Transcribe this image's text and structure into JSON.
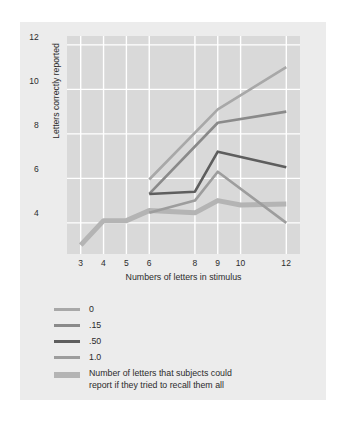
{
  "chart_data": {
    "type": "line",
    "title": "",
    "subtitle": "",
    "xlabel": "Numbers of letters in stimulus",
    "ylabel": "Letters correctly reported",
    "x": [
      3,
      4,
      5,
      6,
      8,
      9,
      10,
      12
    ],
    "xtick_labels": [
      "3",
      "4",
      "5",
      "6",
      "8",
      "9",
      "10",
      "12"
    ],
    "ytick_labels": [
      "4",
      "6",
      "8",
      "10",
      "12"
    ],
    "yticks": [
      4,
      6,
      8,
      10,
      12
    ],
    "xlim": [
      2.4,
      12.6
    ],
    "ylim": [
      2.6,
      12.4
    ],
    "grid": true,
    "grid_color": "#ffffff",
    "plot_background": "#d9d9d9",
    "figure_background": "#ececec",
    "legend_position": "below-plot",
    "series": [
      {
        "name": "0",
        "label": "0",
        "color": "#a8a8a8",
        "width": 2.6,
        "x": [
          6,
          9,
          12
        ],
        "values": [
          5.95,
          9.1,
          11.0
        ]
      },
      {
        "name": ".15",
        "label": ".15",
        "color": "#8a8a8a",
        "width": 2.6,
        "x": [
          6,
          9,
          12
        ],
        "values": [
          5.3,
          8.5,
          9.0
        ]
      },
      {
        "name": ".50",
        "label": ".50",
        "color": "#5e5e5e",
        "width": 2.6,
        "x": [
          6,
          8,
          9,
          12
        ],
        "values": [
          5.3,
          5.4,
          7.2,
          6.5
        ]
      },
      {
        "name": "1.0",
        "label": "1.0",
        "color": "#9d9d9d",
        "width": 2.6,
        "x": [
          6,
          8,
          9,
          12
        ],
        "values": [
          4.45,
          5.0,
          6.3,
          4.0
        ]
      },
      {
        "name": "recall-all-baseline",
        "label": "Number of letters that subjects could",
        "label_line2": "report if they tried to recall them all",
        "color": "#b4b4b4",
        "width": 5.0,
        "x": [
          3,
          4,
          5,
          6,
          8,
          9,
          10,
          12
        ],
        "values": [
          3.0,
          4.1,
          4.1,
          4.55,
          4.45,
          5.0,
          4.8,
          4.85
        ]
      }
    ]
  },
  "axes": {
    "y_label": "Letters correctly reported",
    "x_label": "Numbers of letters in stimulus",
    "y_ticks": [
      "12",
      "10",
      "8",
      "6",
      "4"
    ],
    "x_ticks": [
      "3",
      "4",
      "5",
      "6",
      "8",
      "9",
      "10",
      "12"
    ]
  },
  "legend": {
    "items": [
      {
        "label": "0",
        "label2": "",
        "color": "#a8a8a8",
        "width": "3px"
      },
      {
        "label": ".15",
        "label2": "",
        "color": "#8a8a8a",
        "width": "3px"
      },
      {
        "label": ".50",
        "label2": "",
        "color": "#5e5e5e",
        "width": "3px"
      },
      {
        "label": "1.0",
        "label2": "",
        "color": "#9d9d9d",
        "width": "3px"
      },
      {
        "label": "Number of letters that subjects could",
        "label2": "report if they tried to recall them all",
        "color": "#b4b4b4",
        "width": "6px"
      }
    ]
  }
}
